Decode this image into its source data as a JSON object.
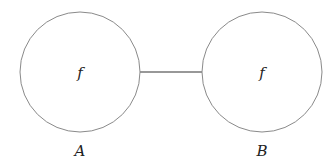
{
  "diagram": {
    "nodes": [
      {
        "id": "A",
        "name": "A",
        "label": "f",
        "cx": 80,
        "cy": 72,
        "r": 60
      },
      {
        "id": "B",
        "name": "B",
        "label": "f",
        "cx": 262,
        "cy": 72,
        "r": 60
      }
    ],
    "edges": [
      {
        "from": "A",
        "to": "B"
      }
    ],
    "colors": {
      "circle_stroke": "#8a8a8a",
      "edge_stroke": "#333333",
      "text": "#222222",
      "background": "#ffffff"
    }
  }
}
